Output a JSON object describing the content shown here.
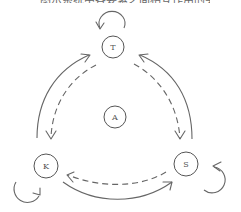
{
  "diagram": {
    "top_caption_clipped": "图示系统中各要素之间相互作用的关系",
    "colors": {
      "stroke": "#666666",
      "node_border": "#555555",
      "background": "#ffffff"
    },
    "nodes": [
      {
        "id": "T",
        "label": "T",
        "cx": 113,
        "cy": 47,
        "r": 11
      },
      {
        "id": "A",
        "label": "A",
        "cx": 115,
        "cy": 117,
        "r": 11
      },
      {
        "id": "K",
        "label": "K",
        "cx": 46,
        "cy": 166,
        "r": 12
      },
      {
        "id": "S",
        "label": "S",
        "cx": 186,
        "cy": 164,
        "r": 12
      }
    ],
    "edges": [
      {
        "from": "K",
        "to": "T",
        "style": "solid",
        "position": "outer-left"
      },
      {
        "from": "T",
        "to": "K",
        "style": "dashed",
        "position": "inner-left"
      },
      {
        "from": "S",
        "to": "T",
        "style": "solid",
        "position": "outer-right"
      },
      {
        "from": "T",
        "to": "S",
        "style": "dashed",
        "position": "inner-right"
      },
      {
        "from": "K",
        "to": "S",
        "style": "solid",
        "position": "outer-bottom"
      },
      {
        "from": "S",
        "to": "K",
        "style": "dashed",
        "position": "inner-bottom"
      }
    ],
    "self_loops": [
      {
        "node": "T",
        "style": "solid",
        "direction": "counter-clockwise"
      },
      {
        "node": "K",
        "style": "solid",
        "direction": "clockwise"
      },
      {
        "node": "S",
        "style": "solid",
        "direction": "counter-clockwise"
      }
    ]
  }
}
